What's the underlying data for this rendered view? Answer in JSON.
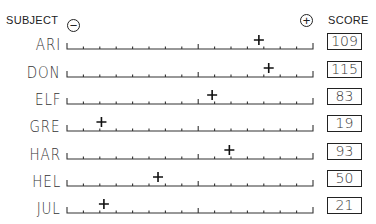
{
  "header": {
    "subject_label": "SUBJECT",
    "score_label": "SCORE",
    "minus_symbol": "−",
    "plus_symbol": "+"
  },
  "chart_data": {
    "type": "scatter",
    "title": "",
    "xlabel": "",
    "ylabel": "SUBJECT",
    "axis_ends": [
      "−",
      "+"
    ],
    "categories": [
      "ARI",
      "DON",
      "ELF",
      "GRE",
      "HAR",
      "HEL",
      "JUL"
    ],
    "scores": [
      109,
      115,
      83,
      19,
      93,
      50,
      21
    ],
    "marker_positions_fraction": [
      0.78,
      0.82,
      0.59,
      0.14,
      0.66,
      0.37,
      0.15
    ],
    "grid": false,
    "ticks_per_axis": 15
  },
  "rows": [
    {
      "subject": "ARI",
      "score": "109",
      "pos": 0.78
    },
    {
      "subject": "DON",
      "score": "115",
      "pos": 0.82
    },
    {
      "subject": "ELF",
      "score": "83",
      "pos": 0.59
    },
    {
      "subject": "GRE",
      "score": "19",
      "pos": 0.14
    },
    {
      "subject": "HAR",
      "score": "93",
      "pos": 0.66
    },
    {
      "subject": "HEL",
      "score": "50",
      "pos": 0.37
    },
    {
      "subject": "JUL",
      "score": "21",
      "pos": 0.15
    }
  ]
}
